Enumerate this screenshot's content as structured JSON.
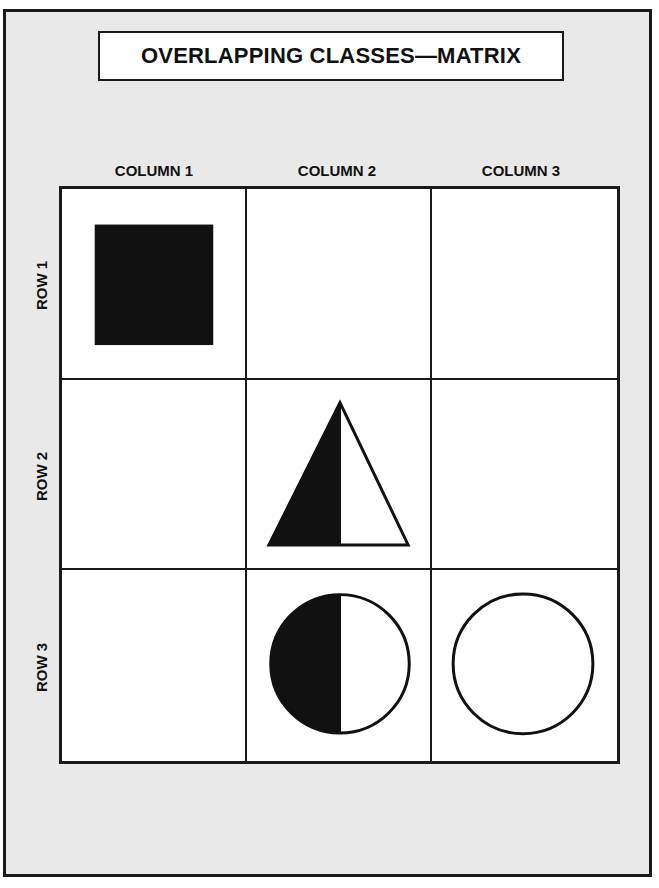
{
  "title": "OVERLAPPING CLASSES—MATRIX",
  "columns": [
    "COLUMN 1",
    "COLUMN 2",
    "COLUMN 3"
  ],
  "rows": [
    "ROW 1",
    "ROW 2",
    "ROW 3"
  ],
  "cells": [
    {
      "row": 1,
      "col": 1,
      "shape": "square",
      "fill": "black"
    },
    {
      "row": 1,
      "col": 2,
      "shape": "none"
    },
    {
      "row": 1,
      "col": 3,
      "shape": "none"
    },
    {
      "row": 2,
      "col": 1,
      "shape": "none"
    },
    {
      "row": 2,
      "col": 2,
      "shape": "triangle",
      "fill": "left-half-black"
    },
    {
      "row": 2,
      "col": 3,
      "shape": "none"
    },
    {
      "row": 3,
      "col": 1,
      "shape": "none"
    },
    {
      "row": 3,
      "col": 2,
      "shape": "circle",
      "fill": "left-half-black"
    },
    {
      "row": 3,
      "col": 3,
      "shape": "circle",
      "fill": "white"
    }
  ],
  "colors": {
    "ink": "#1a1a1a",
    "background": "#e9e9e9",
    "cell": "#ffffff"
  }
}
